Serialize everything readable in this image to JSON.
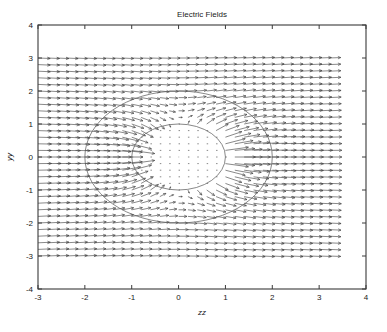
{
  "figure": {
    "background_color": "#ffffff",
    "axes_color": "#3a3a3a",
    "arrow_color": "#3f3f3f",
    "circle_color": "#555555"
  },
  "chart_data": {
    "type": "scatter",
    "plot_style": "quiver-vector-field",
    "title": "Electric Fields",
    "xlabel": "zz",
    "ylabel": "yy",
    "xlim": [
      -3,
      4
    ],
    "ylim": [
      -4,
      4
    ],
    "xticks": [
      -3,
      -2,
      -1,
      0,
      1,
      2,
      3,
      4
    ],
    "xtick_labels": [
      "-3",
      "-2",
      "-1",
      "0",
      "1",
      "2",
      "3",
      "4"
    ],
    "yticks": [
      -4,
      -3,
      -2,
      -1,
      0,
      1,
      2,
      3,
      4
    ],
    "ytick_labels": [
      "-4",
      "-3",
      "-2",
      "-1",
      "0",
      "1",
      "2",
      "3",
      "4"
    ],
    "grid": false,
    "legend": null,
    "field": {
      "description": "Electric field vectors of a uniform field distorted by a dielectric/conducting cylinder centred at the origin",
      "domain_x": [
        -3.0,
        3.2
      ],
      "domain_y": [
        -3.0,
        3.0
      ],
      "grid_step": 0.2,
      "arrow_scale": 0.26,
      "uniform_field_direction_deg": 0,
      "cylinder_radius": 1.0,
      "outer_radius": 2.0,
      "interior_field_factor": 0.12,
      "dipole_strength": 1.0
    },
    "annotations": [
      {
        "shape": "circle",
        "cx": 0,
        "cy": 0,
        "r": 1,
        "label": "inner-circle-r1"
      },
      {
        "shape": "circle",
        "cx": 0,
        "cy": 0,
        "r": 2,
        "label": "outer-circle-r2"
      }
    ]
  }
}
